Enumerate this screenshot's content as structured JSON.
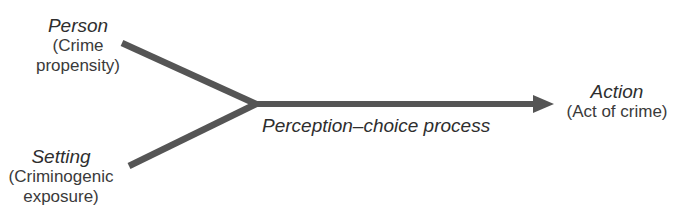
{
  "diagram": {
    "colors": {
      "line": "#555555",
      "text": "#333333",
      "background": "#ffffff"
    },
    "nodes": {
      "person": {
        "title": "Person",
        "subtitle_line1": "(Crime",
        "subtitle_line2": "propensity)"
      },
      "setting": {
        "title": "Setting",
        "subtitle_line1": "(Criminogenic",
        "subtitle_line2": "exposure)"
      },
      "action": {
        "title": "Action",
        "subtitle_line1": "(Act of crime)"
      }
    },
    "process": {
      "label": "Perception–choice process"
    },
    "edges": [
      {
        "from": "person",
        "to": "junction"
      },
      {
        "from": "setting",
        "to": "junction"
      },
      {
        "from": "junction",
        "to": "action",
        "label": "Perception–choice process",
        "arrow": true
      }
    ]
  }
}
